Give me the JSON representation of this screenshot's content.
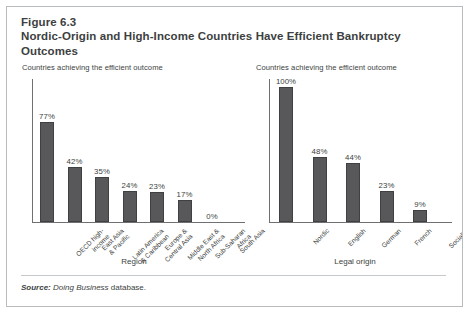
{
  "figure": {
    "number": "Figure 6.3",
    "title": "Nordic-Origin and High-Income Countries Have Efficient Bankruptcy Outcomes",
    "source_prefix": "Source:",
    "source_italic": "Doing Business",
    "source_rest": "database."
  },
  "panels": {
    "left": {
      "subtitle": "Countries achieving the efficient outcome",
      "axis_title": "Region"
    },
    "right": {
      "subtitle": "Countries achieving the efficient outcome",
      "axis_title": "Legal origin"
    }
  },
  "colors": {
    "bar_fill": "#58585a",
    "bar_stroke": "#3f4042",
    "text": "#3d3f41",
    "frame": "#b9bcbe",
    "axis": "#6e7072"
  },
  "chart_data": [
    {
      "type": "bar",
      "id": "region-chart",
      "title": "Countries achieving the efficient outcome",
      "xlabel": "Region",
      "ylabel": "",
      "ylim": [
        0,
        100
      ],
      "grid": false,
      "legend": "none",
      "categories": [
        "OECD high-income",
        "East Asia & Pacific",
        "Latin America & Caribbean",
        "Europe & Central Asia",
        "Middle East & North Africa",
        "Sub-Saharan Africa",
        "South Asia"
      ],
      "category_lines": [
        [
          "OECD high-",
          "income"
        ],
        [
          "East Asia",
          "& Pacific"
        ],
        [
          "Latin America",
          "& Caribbean"
        ],
        [
          "Europe &",
          "Central Asia"
        ],
        [
          "Middle East &",
          "North Africa"
        ],
        [
          "Sub-Saharan",
          "Africa"
        ],
        [
          "South Asia"
        ]
      ],
      "values": [
        77,
        42,
        35,
        24,
        23,
        17,
        0
      ],
      "data_labels": [
        "77%",
        "42%",
        "35%",
        "24%",
        "23%",
        "17%",
        "0%"
      ]
    },
    {
      "type": "bar",
      "id": "legal-origin-chart",
      "title": "Countries achieving the efficient outcome",
      "xlabel": "Legal origin",
      "ylabel": "",
      "ylim": [
        0,
        100
      ],
      "grid": false,
      "legend": "none",
      "categories": [
        "Nordic",
        "English",
        "German",
        "French",
        "Socialist"
      ],
      "category_lines": [
        [
          "Nordic"
        ],
        [
          "English"
        ],
        [
          "German"
        ],
        [
          "French"
        ],
        [
          "Socialist"
        ]
      ],
      "values": [
        100,
        48,
        44,
        23,
        9
      ],
      "data_labels": [
        "100%",
        "48%",
        "44%",
        "23%",
        "9%"
      ]
    }
  ]
}
